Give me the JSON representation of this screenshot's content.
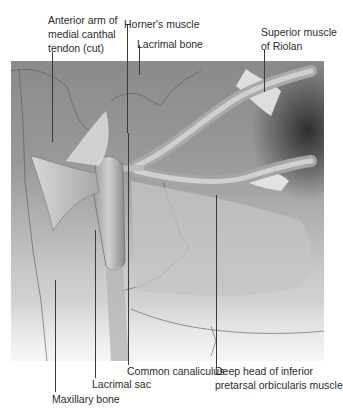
{
  "figure": {
    "labels": {
      "anterior_arm": "Anterior arm of\nmedial canthal\ntendon (cut)",
      "horners_muscle": "Horner's muscle",
      "lacrimal_bone": "Lacrimal bone",
      "superior_riolan": "Superior muscle\nof Riolan",
      "common_canaliculus": "Common canaliculus",
      "deep_head": "Deep head of inferior\npretarsal orbicularis muscle",
      "lacrimal_sac": "Lacrimal sac",
      "maxillary_bone": "Maxillary bone"
    }
  }
}
